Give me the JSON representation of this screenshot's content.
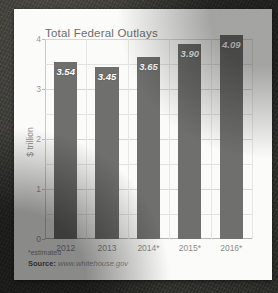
{
  "card": {
    "footnote": "*estimated",
    "source_label": "Source:",
    "source_url": "www.whitehouse.gov"
  },
  "chart_data": {
    "type": "bar",
    "title": "Total Federal Outlays",
    "xlabel": "",
    "ylabel": "$ trillion",
    "categories": [
      "2012",
      "2013",
      "2014*",
      "2015*",
      "2016*"
    ],
    "values": [
      3.54,
      3.45,
      3.65,
      3.9,
      4.09
    ],
    "value_labels": [
      "3.54",
      "3.45",
      "3.65",
      "3.90",
      "4.09"
    ],
    "ylim": [
      0,
      4
    ],
    "yticks": [
      0,
      1,
      2,
      3,
      4
    ],
    "ytick_labels": [
      "0",
      "1",
      "2",
      "3",
      "4"
    ],
    "minor_gridlines": [
      0.5,
      1.5,
      2.5,
      3.5
    ],
    "grid": true,
    "legend": "none",
    "bar_color": "#6f6f6e",
    "label_color": "#ffffff",
    "background_color": "#fbfbf9"
  }
}
